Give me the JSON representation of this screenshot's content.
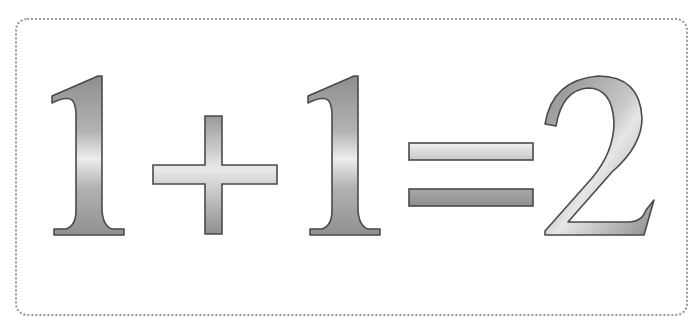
{
  "equation": {
    "text": "1+1=2",
    "tokens": [
      {
        "glyph": "1",
        "role": "operand"
      },
      {
        "glyph": "+",
        "role": "operator"
      },
      {
        "glyph": "1",
        "role": "operand"
      },
      {
        "glyph": "=",
        "role": "equals"
      },
      {
        "glyph": "2",
        "role": "result"
      }
    ]
  },
  "colors": {
    "background": "#ffffff",
    "border": "#9a9a9a",
    "glyph_outline": "#4a4a4a",
    "gradient_dark": "#8c8c8c",
    "gradient_mid": "#b0b0b0",
    "gradient_light": "#ececec"
  }
}
